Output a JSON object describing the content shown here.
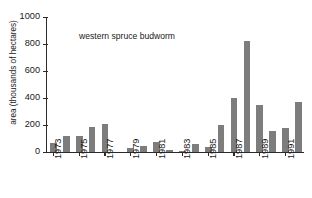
{
  "chart_data": {
    "type": "bar",
    "title": "",
    "annotation": "western spruce budworm",
    "xlabel": "",
    "ylabel": "area (thousands of hectares)",
    "ylim": [
      0,
      1000
    ],
    "y_ticks": [
      0,
      200,
      400,
      600,
      800,
      1000
    ],
    "grid": false,
    "legend": "none",
    "bar_color": "#7d7d7d",
    "axis_color": "#2b2b2b",
    "x_tick_labels": [
      "1973",
      "1975",
      "1977",
      "1979",
      "1981",
      "1983",
      "1985",
      "1987",
      "1989",
      "1991"
    ],
    "categories": [
      "1973",
      "1974",
      "1975",
      "1976",
      "1977",
      "1978",
      "1979",
      "1980",
      "1981",
      "1982",
      "1983",
      "1984",
      "1985",
      "1986",
      "1987",
      "1988",
      "1989",
      "1990",
      "1991",
      "1992"
    ],
    "values": [
      65,
      120,
      120,
      185,
      210,
      0,
      30,
      45,
      75,
      15,
      8,
      60,
      40,
      200,
      400,
      820,
      345,
      155,
      175,
      370
    ]
  }
}
